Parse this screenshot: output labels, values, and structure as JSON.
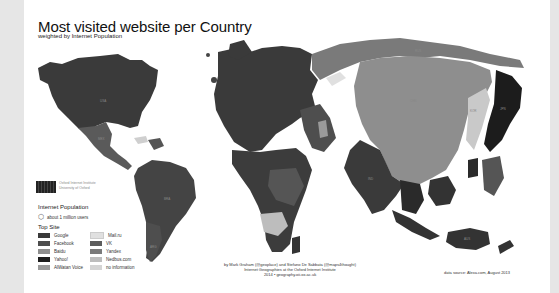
{
  "map": {
    "title": "Most visited website per Country",
    "subtitle": "weighted by Internet Population",
    "institute": {
      "line1": "Oxford Internet Institute",
      "line2": "University of Oxford"
    },
    "population_legend": {
      "title": "Internet Population",
      "item": "about 1 million users",
      "icon": "hexagon-cluster-icon"
    },
    "top_site_legend": {
      "title": "Top Site",
      "items": [
        {
          "label": "Google",
          "color": "#3a3a3a"
        },
        {
          "label": "Facebook",
          "color": "#4d4d4d"
        },
        {
          "label": "Baidu",
          "color": "#8e8e8e"
        },
        {
          "label": "Yahoo!",
          "color": "#1c1c1c"
        },
        {
          "label": "AlWatan Voice",
          "color": "#9a9a9a"
        },
        {
          "label": "Mail.ru",
          "color": "#e0e0e0"
        },
        {
          "label": "VK",
          "color": "#5c5c5c"
        },
        {
          "label": "Yandex",
          "color": "#7a7a7a"
        },
        {
          "label": "Nedbus.com",
          "color": "#bdbdbd"
        },
        {
          "label": "no information",
          "color": "#d4d4d4"
        }
      ]
    },
    "credit": {
      "line1": "by Mark Graham (@geoplace) and Stefano De Sabbata (@maps4thought)",
      "line2": "Internet Geographies at the Oxford Internet Institute",
      "line3": "2014 • geography.oii.ox.ac.uk"
    },
    "source": "data source: Alexa.com, August 2013",
    "country_labels": {
      "usa": "USA",
      "mex": "MEX",
      "bra": "BRA",
      "arg": "ARG",
      "rus": "RUS",
      "chn": "CHN",
      "jpn": "JPN",
      "ind": "IND",
      "aus": "AUS",
      "kor": "KOR",
      "can": "CAN",
      "col": "COL",
      "zaf": "ZAF",
      "egy": "EGY",
      "idn": "IDN"
    }
  }
}
